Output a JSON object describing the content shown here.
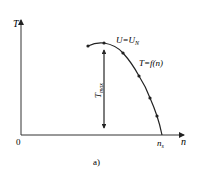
{
  "figure": {
    "caption": "a)",
    "y_axis_label": "T",
    "x_axis_label": "n",
    "origin_label": "0",
    "curve_label_voltage": "U=U",
    "curve_label_voltage_sub": "N",
    "curve_label_function": "T=f(n)",
    "tmax_label": "T",
    "tmax_sub": "max",
    "ns_label": "n",
    "ns_sub": "s"
  },
  "colors": {
    "line": "#222222",
    "background": "#ffffff"
  }
}
